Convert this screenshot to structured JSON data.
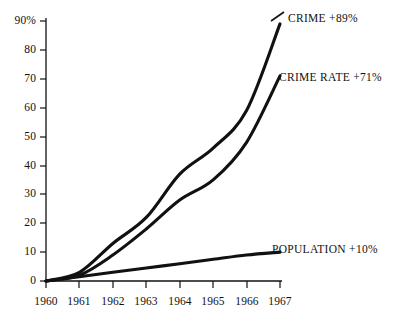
{
  "chart_data": {
    "type": "line",
    "title": "",
    "subtitle": "",
    "xlabel": "",
    "ylabel": "",
    "grid": false,
    "legend_position": "inline-right",
    "x": [
      1960,
      1961,
      1962,
      1963,
      1964,
      1965,
      1966,
      1967
    ],
    "categories": [
      "1960",
      "1961",
      "1962",
      "1963",
      "1964",
      "1965",
      "1966",
      "1967"
    ],
    "xlim": [
      1960,
      1967
    ],
    "ylim": [
      0,
      90
    ],
    "y_ticks": [
      0,
      10,
      20,
      30,
      40,
      50,
      60,
      70,
      80,
      90
    ],
    "y_tick_labels": [
      "0",
      "10",
      "20",
      "30",
      "40",
      "50",
      "60",
      "70",
      "80",
      "90%"
    ],
    "x_ticks": [
      1960,
      1961,
      1962,
      1963,
      1964,
      1965,
      1966,
      1967
    ],
    "x_tick_labels": [
      "1960",
      "1961",
      "1962",
      "1963",
      "1964",
      "1965",
      "1966",
      "1967"
    ],
    "units": "percent increase since 1960",
    "series": [
      {
        "name": "CRIME",
        "label": "CRIME  +89%",
        "change": "+89%",
        "color": "#111111",
        "values": [
          0,
          3,
          13,
          22,
          37,
          46,
          59,
          89
        ]
      },
      {
        "name": "CRIME RATE",
        "label": "CRIME RATE  +71%",
        "change": "+71%",
        "color": "#111111",
        "values": [
          0,
          2,
          9,
          18,
          28,
          35,
          48,
          71
        ]
      },
      {
        "name": "POPULATION",
        "label": "POPULATION  +10%",
        "change": "+10%",
        "color": "#111111",
        "values": [
          0,
          1.5,
          3,
          4.5,
          6,
          7.5,
          9,
          10
        ]
      }
    ]
  },
  "axis": {
    "y_tick_0": "0",
    "y_tick_10": "10",
    "y_tick_20": "20",
    "y_tick_30": "30",
    "y_tick_40": "40",
    "y_tick_50": "50",
    "y_tick_60": "60",
    "y_tick_70": "70",
    "y_tick_80": "80",
    "y_tick_90": "90%",
    "x_tick_1960": "1960",
    "x_tick_1961": "1961",
    "x_tick_1962": "1962",
    "x_tick_1963": "1963",
    "x_tick_1964": "1964",
    "x_tick_1965": "1965",
    "x_tick_1966": "1966",
    "x_tick_1967": "1967"
  },
  "annotations": {
    "crime": "CRIME  +89%",
    "crime_rate": "CRIME RATE  +71%",
    "population": "POPULATION  +10%"
  },
  "colors": {
    "line": "#111111",
    "axis": "#111111",
    "background": "#ffffff",
    "text": "#111111"
  }
}
